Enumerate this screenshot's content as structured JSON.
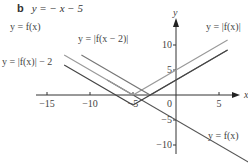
{
  "header": {
    "part": "b",
    "equation": "y = − x − 5"
  },
  "chart_data": {
    "type": "line",
    "xlabel": "x",
    "ylabel": "y",
    "xlim": [
      -17,
      7
    ],
    "ylim": [
      -11,
      13
    ],
    "xticks": [
      -15,
      -10,
      -5,
      0,
      5
    ],
    "yticks": [
      -10,
      -5,
      5,
      10
    ],
    "grid": false,
    "series": [
      {
        "name": "y = f(x)",
        "color": "#555555",
        "points": [
          [
            -8,
            3
          ],
          [
            14,
            -19
          ]
        ],
        "formula": "-x-5"
      },
      {
        "name": "y = |f(x)|",
        "color": "#9a9a9a",
        "points": [
          [
            -13,
            8
          ],
          [
            -5,
            0
          ],
          [
            6,
            11
          ]
        ],
        "formula": "|-x-5|"
      },
      {
        "name": "y = |f(x − 2)|",
        "color": "#777777",
        "points": [
          [
            -11,
            8
          ],
          [
            -3,
            0
          ],
          [
            6,
            9
          ]
        ],
        "formula": "|-x-3|"
      },
      {
        "name": "y = |f(x)| − 2",
        "color": "#444444",
        "points": [
          [
            -13,
            6
          ],
          [
            -5,
            -2
          ],
          [
            6,
            9
          ]
        ],
        "formula": "|-x-5|-2"
      }
    ],
    "labels": {
      "f": "y = f(x)",
      "abs_f": "y = |f(x)|",
      "abs_f_shift": "y = |f(x − 2)|",
      "abs_f_minus2": "y = |f(x)| − 2",
      "f_right": "y = f(x)"
    }
  }
}
